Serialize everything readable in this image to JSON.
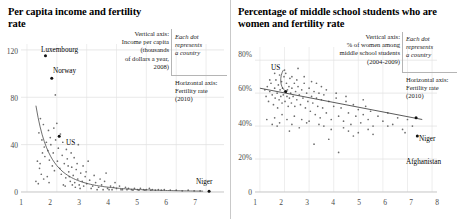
{
  "figure": {
    "panels": [
      {
        "id": "left",
        "title": "Per capita income\nand fertility rate",
        "annotation": {
          "vertical_axis": "Vertical axis:\nIncome per capita\n(thousands\nof dollars a year,\n2008)",
          "each_dot": "Each dot\nrepresents\na country",
          "horizontal_axis": "Horizontal axis:\nFertility rate\n(2010)"
        },
        "point_labels": [
          {
            "text": "Luxembourg",
            "x": 1.62,
            "y": 115
          },
          {
            "text": "Norway",
            "x": 1.83,
            "y": 96
          },
          {
            "text": "US",
            "x": 2.08,
            "y": 47
          },
          {
            "text": "Niger",
            "x": 7.1,
            "y": 0.7
          }
        ]
      },
      {
        "id": "right",
        "title": "Percentage of middle school students\nwho are women and fertility rate",
        "annotation": {
          "vertical_axis": "Vertical axis:\n% of women among\nmiddle school students\n(2004-2009)",
          "each_dot": "Each dot\nrepresents\na country",
          "horizontal_axis": "Horizontal axis:\nFertility rate\n(2010)"
        },
        "point_labels": [
          {
            "text": "US",
            "x": 2.05,
            "y": 72
          },
          {
            "text": "Niger",
            "x": 7.35,
            "y": 45
          },
          {
            "text": "Afghanistan",
            "x": 7.4,
            "y": 34
          }
        ]
      }
    ]
  },
  "chart_data": [
    {
      "type": "scatter",
      "title": "Per capita income and fertility rate",
      "xlabel": "Fertility rate (2010)",
      "ylabel": "Income per capita (thousands of dollars a year, 2008)",
      "xlim": [
        0.8,
        7.6
      ],
      "ylim": [
        0,
        125
      ],
      "xticks": [
        1,
        2,
        3,
        4,
        5,
        6,
        7
      ],
      "xticklabels": [
        "1",
        "2",
        "3",
        "4",
        "5",
        "6",
        "7"
      ],
      "yticks": [
        0,
        40,
        80,
        120
      ],
      "yticklabels": [
        "0",
        "40",
        "80",
        "120"
      ],
      "grid": "light-gridlines",
      "legend": "none",
      "trend": "decaying-power-curve",
      "points": [
        [
          1.62,
          115
        ],
        [
          1.83,
          96
        ],
        [
          1.95,
          82
        ],
        [
          2.08,
          47
        ],
        [
          1.4,
          50
        ],
        [
          1.45,
          62
        ],
        [
          1.5,
          44
        ],
        [
          1.55,
          57
        ],
        [
          1.58,
          38
        ],
        [
          1.6,
          30
        ],
        [
          1.65,
          42
        ],
        [
          1.7,
          35
        ],
        [
          1.72,
          52
        ],
        [
          1.75,
          27
        ],
        [
          1.78,
          46
        ],
        [
          1.8,
          40
        ],
        [
          1.85,
          22
        ],
        [
          1.88,
          33
        ],
        [
          1.9,
          54
        ],
        [
          1.92,
          18
        ],
        [
          1.96,
          44
        ],
        [
          2.0,
          58
        ],
        [
          2.02,
          26
        ],
        [
          2.05,
          37
        ],
        [
          2.1,
          20
        ],
        [
          2.12,
          49
        ],
        [
          2.15,
          15
        ],
        [
          2.18,
          31
        ],
        [
          2.2,
          42
        ],
        [
          2.25,
          24
        ],
        [
          2.3,
          12
        ],
        [
          2.35,
          28
        ],
        [
          2.4,
          17
        ],
        [
          2.45,
          9
        ],
        [
          2.5,
          21
        ],
        [
          2.55,
          14
        ],
        [
          2.6,
          8
        ],
        [
          2.65,
          19
        ],
        [
          2.7,
          11
        ],
        [
          2.75,
          6
        ],
        [
          2.8,
          16
        ],
        [
          2.85,
          9
        ],
        [
          2.9,
          5
        ],
        [
          2.95,
          13
        ],
        [
          3.0,
          7
        ],
        [
          3.1,
          10
        ],
        [
          3.2,
          5
        ],
        [
          3.3,
          8
        ],
        [
          3.4,
          4
        ],
        [
          3.5,
          6
        ],
        [
          3.6,
          9
        ],
        [
          3.7,
          3
        ],
        [
          3.8,
          5
        ],
        [
          3.9,
          4
        ],
        [
          4.0,
          3
        ],
        [
          4.1,
          5
        ],
        [
          4.2,
          2
        ],
        [
          4.3,
          4
        ],
        [
          4.4,
          3
        ],
        [
          4.5,
          2
        ],
        [
          4.6,
          3
        ],
        [
          4.7,
          2
        ],
        [
          4.8,
          3
        ],
        [
          4.9,
          2
        ],
        [
          5.0,
          2
        ],
        [
          5.1,
          3
        ],
        [
          5.2,
          2
        ],
        [
          5.3,
          1.5
        ],
        [
          5.4,
          2
        ],
        [
          5.5,
          1.5
        ],
        [
          5.6,
          2
        ],
        [
          5.8,
          1.5
        ],
        [
          6.0,
          1.5
        ],
        [
          6.2,
          1
        ],
        [
          6.4,
          1.5
        ],
        [
          6.6,
          1
        ],
        [
          6.8,
          1
        ],
        [
          7.1,
          0.7
        ],
        [
          1.35,
          26
        ],
        [
          1.42,
          20
        ],
        [
          1.48,
          15
        ],
        [
          1.52,
          33
        ],
        [
          1.56,
          11
        ],
        [
          1.3,
          9
        ],
        [
          1.38,
          7
        ],
        [
          1.44,
          24
        ],
        [
          1.68,
          13
        ],
        [
          1.74,
          8
        ],
        [
          2.22,
          6
        ],
        [
          2.28,
          5
        ],
        [
          2.32,
          36
        ],
        [
          2.38,
          22
        ],
        [
          2.42,
          13
        ],
        [
          2.48,
          33
        ],
        [
          2.52,
          6
        ],
        [
          2.58,
          29
        ],
        [
          2.62,
          4
        ],
        [
          2.68,
          24
        ],
        [
          2.72,
          40
        ],
        [
          2.78,
          3
        ],
        [
          2.88,
          22
        ],
        [
          2.98,
          17
        ],
        [
          3.05,
          26
        ],
        [
          3.15,
          3
        ],
        [
          3.25,
          14
        ],
        [
          3.35,
          2
        ],
        [
          3.45,
          11
        ],
        [
          3.55,
          2
        ],
        [
          3.65,
          16
        ],
        [
          3.75,
          2
        ],
        [
          3.85,
          2
        ],
        [
          3.95,
          8
        ],
        [
          4.15,
          2
        ],
        [
          4.35,
          2
        ],
        [
          4.55,
          1.5
        ],
        [
          4.75,
          1.5
        ],
        [
          4.95,
          1.5
        ],
        [
          5.15,
          1.5
        ]
      ]
    },
    {
      "type": "scatter",
      "title": "Percentage of middle school students who are women and fertility rate",
      "xlabel": "Fertility rate (2010)",
      "ylabel": "% of women among middle school students (2004-2009)",
      "xlim": [
        0.8,
        8.2
      ],
      "ylim": [
        0,
        88
      ],
      "xticks": [
        1,
        2,
        3,
        4,
        5,
        6,
        7,
        8
      ],
      "xticklabels": [
        "1",
        "2",
        "3",
        "4",
        "5",
        "6",
        "7",
        "8"
      ],
      "yticks": [
        0,
        20,
        40,
        60,
        80
      ],
      "yticklabels": [
        "0",
        "20%",
        "40%",
        "60%",
        "80%"
      ],
      "grid": "light-gridlines",
      "legend": "none",
      "trend": "negative-linear",
      "trendline": {
        "x0": 1.0,
        "y0": 63,
        "x1": 7.6,
        "y1": 44
      },
      "points": [
        [
          2.05,
          72
        ],
        [
          7.35,
          45
        ],
        [
          7.4,
          34
        ],
        [
          1.2,
          62
        ],
        [
          1.25,
          58
        ],
        [
          1.3,
          64
        ],
        [
          1.35,
          55
        ],
        [
          1.4,
          61
        ],
        [
          1.45,
          66
        ],
        [
          1.5,
          59
        ],
        [
          1.55,
          53
        ],
        [
          1.6,
          63
        ],
        [
          1.62,
          57
        ],
        [
          1.65,
          68
        ],
        [
          1.7,
          60
        ],
        [
          1.72,
          51
        ],
        [
          1.75,
          65
        ],
        [
          1.78,
          56
        ],
        [
          1.8,
          71
        ],
        [
          1.82,
          62
        ],
        [
          1.85,
          58
        ],
        [
          1.88,
          67
        ],
        [
          1.9,
          54
        ],
        [
          1.92,
          63
        ],
        [
          1.95,
          59
        ],
        [
          1.98,
          70
        ],
        [
          2.0,
          61
        ],
        [
          2.02,
          55
        ],
        [
          2.08,
          66
        ],
        [
          2.1,
          58
        ],
        [
          2.12,
          62
        ],
        [
          2.15,
          52
        ],
        [
          2.18,
          64
        ],
        [
          2.2,
          57
        ],
        [
          2.22,
          69
        ],
        [
          2.25,
          60
        ],
        [
          2.28,
          54
        ],
        [
          2.3,
          63
        ],
        [
          2.35,
          58
        ],
        [
          2.4,
          66
        ],
        [
          2.42,
          52
        ],
        [
          2.45,
          61
        ],
        [
          2.5,
          56
        ],
        [
          2.55,
          64
        ],
        [
          2.6,
          59
        ],
        [
          2.65,
          53
        ],
        [
          2.7,
          62
        ],
        [
          2.75,
          57
        ],
        [
          2.8,
          66
        ],
        [
          2.85,
          51
        ],
        [
          2.9,
          60
        ],
        [
          2.95,
          55
        ],
        [
          3.0,
          63
        ],
        [
          3.05,
          49
        ],
        [
          3.1,
          58
        ],
        [
          3.15,
          54
        ],
        [
          3.2,
          61
        ],
        [
          3.25,
          47
        ],
        [
          3.3,
          57
        ],
        [
          3.35,
          52
        ],
        [
          3.4,
          60
        ],
        [
          3.45,
          45
        ],
        [
          3.5,
          56
        ],
        [
          3.55,
          51
        ],
        [
          3.6,
          59
        ],
        [
          3.7,
          48
        ],
        [
          3.8,
          55
        ],
        [
          3.9,
          44
        ],
        [
          4.0,
          52
        ],
        [
          4.1,
          57
        ],
        [
          4.2,
          46
        ],
        [
          4.3,
          51
        ],
        [
          4.4,
          43
        ],
        [
          4.5,
          55
        ],
        [
          4.6,
          48
        ],
        [
          4.7,
          41
        ],
        [
          4.8,
          53
        ],
        [
          4.9,
          46
        ],
        [
          5.0,
          50
        ],
        [
          5.1,
          42
        ],
        [
          5.2,
          47
        ],
        [
          5.3,
          52
        ],
        [
          5.4,
          44
        ],
        [
          5.5,
          49
        ],
        [
          5.6,
          40
        ],
        [
          5.8,
          46
        ],
        [
          6.0,
          43
        ],
        [
          6.2,
          48
        ],
        [
          6.4,
          41
        ],
        [
          6.6,
          45
        ],
        [
          6.8,
          38
        ],
        [
          7.0,
          44
        ],
        [
          7.2,
          40
        ],
        [
          1.28,
          44
        ],
        [
          1.5,
          41
        ],
        [
          1.6,
          45
        ],
        [
          1.8,
          42
        ],
        [
          2.1,
          44
        ],
        [
          2.6,
          39
        ],
        [
          3.0,
          43
        ],
        [
          3.2,
          29
        ],
        [
          3.4,
          41
        ],
        [
          4.2,
          24
        ],
        [
          3.9,
          38
        ],
        [
          4.6,
          37
        ],
        [
          2.3,
          41
        ],
        [
          2.9,
          42
        ],
        [
          5.0,
          36
        ],
        [
          5.4,
          38
        ],
        [
          6.2,
          40
        ],
        [
          6.9,
          36
        ],
        [
          1.9,
          47
        ],
        [
          2.4,
          46
        ],
        [
          3.6,
          40
        ],
        [
          4.4,
          39
        ],
        [
          4.8,
          34
        ],
        [
          2.2,
          37
        ],
        [
          1.7,
          40
        ],
        [
          2.7,
          44
        ],
        [
          3.8,
          32
        ],
        [
          5.6,
          35
        ],
        [
          1.4,
          68
        ],
        [
          1.6,
          72
        ],
        [
          2.0,
          74
        ],
        [
          2.3,
          70
        ],
        [
          2.5,
          68
        ],
        [
          2.8,
          70
        ],
        [
          3.1,
          67
        ],
        [
          3.3,
          66
        ],
        [
          3.7,
          62
        ],
        [
          4.1,
          60
        ],
        [
          4.5,
          58
        ],
        [
          5.2,
          56
        ],
        [
          2.55,
          75
        ],
        [
          3.5,
          64
        ]
      ]
    }
  ]
}
